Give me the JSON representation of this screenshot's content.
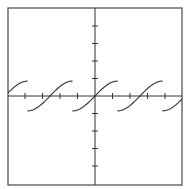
{
  "chart_data": {
    "type": "line",
    "title": "",
    "xlabel": "",
    "ylabel": "",
    "function": "y = A*sin(x - k*P) for x in [k*P - P/2, k*P + P/2]",
    "amplitude_ticks": 0.85,
    "period_ticks": 2.57,
    "zero_crossings_ticks": [
      -5.14,
      -2.57,
      0,
      2.57,
      5.14
    ],
    "x_ticks": [
      -4,
      -3,
      -2,
      -1,
      1,
      2,
      3,
      4
    ],
    "y_ticks": [
      -4,
      -3,
      -2,
      -1,
      1,
      2,
      3,
      4
    ],
    "xlim": [
      -5.0,
      5.0
    ],
    "ylim": [
      -5.0,
      5.0
    ],
    "grid": false,
    "legend": null,
    "tick_labels_shown": false,
    "colors": {
      "axis": "#333333",
      "curve": "#333333",
      "frame": "#555555",
      "background": "#ffffff"
    }
  },
  "layout": {
    "frame": {
      "left": 8,
      "top": 8,
      "right": 182,
      "bottom": 185
    },
    "origin_px": {
      "x": 95,
      "y": 96
    },
    "tick_spacing_px": 17.5,
    "tick_length_px": 3
  }
}
